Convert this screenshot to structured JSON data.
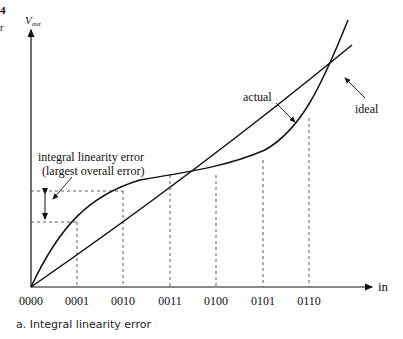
{
  "figure": {
    "caption": "a. Integral linearity error",
    "y_axis_label": "V",
    "y_axis_sub": "out",
    "x_axis_label": "in",
    "x_ticks": [
      "0000",
      "0001",
      "0010",
      "0011",
      "0100",
      "0101",
      "0110"
    ],
    "labels": {
      "actual": "actual",
      "ideal": "ideal",
      "error_line1": "integral linearity error",
      "error_line2": "(largest overall error)"
    },
    "margin_marks": [
      "4",
      "r"
    ]
  }
}
